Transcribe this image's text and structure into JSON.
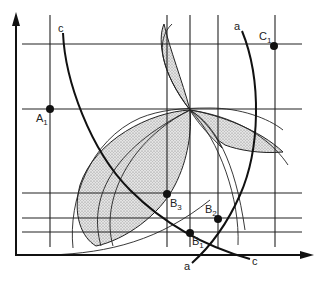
{
  "figure": {
    "type": "geometric-construction-diagram",
    "colors": {
      "ink": "#222222",
      "shade": "#bdbdbd",
      "background": "#ffffff"
    },
    "axes": {
      "origin": [
        16,
        255
      ],
      "y_arrow_tip": [
        16,
        12
      ],
      "x_arrow_tip": [
        314,
        255
      ]
    },
    "vertical_lines_x": [
      50,
      167,
      190,
      218,
      275
    ],
    "horizontal_lines_y": [
      44,
      109,
      193,
      218,
      232
    ],
    "curves": [
      {
        "id": "c",
        "label": "c",
        "label_top": "c",
        "label_bottom": "c"
      },
      {
        "id": "a",
        "label": "a",
        "label_top": "a",
        "label_bottom": "a"
      }
    ],
    "points": [
      {
        "id": "A1",
        "letter": "A",
        "sub": "1",
        "x": 50,
        "y": 109
      },
      {
        "id": "C1",
        "letter": "C",
        "sub": "1",
        "x": 274,
        "y": 46
      },
      {
        "id": "B3",
        "letter": "B",
        "sub": "3",
        "x": 167,
        "y": 194
      },
      {
        "id": "B2",
        "letter": "B",
        "sub": "2",
        "x": 218,
        "y": 219
      },
      {
        "id": "B1",
        "letter": "B",
        "sub": "1",
        "x": 190,
        "y": 233
      }
    ],
    "focal_point": [
      190,
      110
    ]
  }
}
